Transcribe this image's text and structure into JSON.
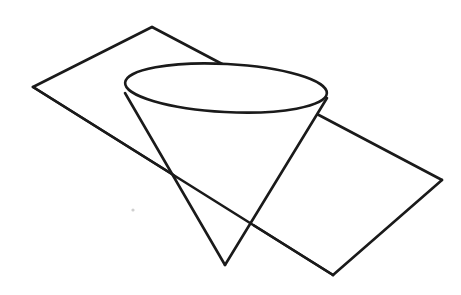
{
  "figure": {
    "background_color": "#ffffff",
    "stroke_color": "#1a1a1a",
    "stroke_width": 2.6,
    "canvas": {
      "width": 461,
      "height": 295
    }
  },
  "shapes": {
    "plane": {
      "name": "intersecting-plane",
      "type": "parallelogram",
      "vertices": [
        {
          "label": "top",
          "x": 152,
          "y": 27
        },
        {
          "label": "right",
          "x": 442,
          "y": 180
        },
        {
          "label": "bottom",
          "x": 333,
          "y": 275
        },
        {
          "label": "left",
          "x": 33,
          "y": 87
        }
      ],
      "hidden_segment": {
        "label": "top-right-edge-behind-cone",
        "from": {
          "x": 240,
          "y": 73
        },
        "to": {
          "x": 322,
          "y": 112
        }
      }
    },
    "cone": {
      "name": "cone",
      "apex": {
        "x": 225,
        "y": 265
      },
      "base_ellipse": {
        "center_x": 226,
        "center_y": 88,
        "radius_x": 101,
        "radius_y": 24,
        "rotation_deg": 3
      },
      "left_generator": {
        "from": {
          "x": 125,
          "y": 93
        },
        "to": {
          "x": 225,
          "y": 265
        }
      },
      "right_generator": {
        "from": {
          "x": 327,
          "y": 98
        },
        "to": {
          "x": 225,
          "y": 265
        }
      }
    }
  },
  "intersections": [
    {
      "label": "plane-crosses-left-generator",
      "x": 178,
      "y": 180
    },
    {
      "label": "plane-crosses-right-generator",
      "x": 253,
      "y": 226
    }
  ],
  "artifacts": {
    "speck": {
      "label": "scan-speck",
      "x": 133,
      "y": 210,
      "radius": 1.6
    }
  }
}
